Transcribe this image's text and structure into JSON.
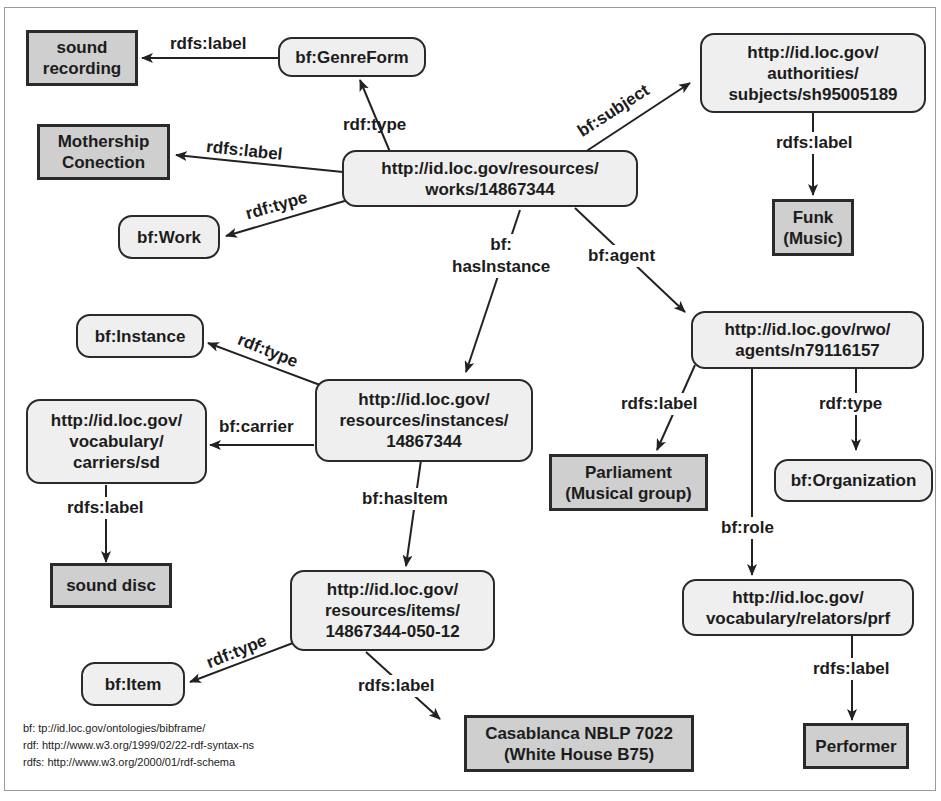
{
  "nodes": {
    "genreform": "bf:GenreForm",
    "sound_recording": "sound\nrecording",
    "mothership": "Mothership\nConection",
    "work_class": "bf:Work",
    "work": "http://id.loc.gov/resources/\nworks/14867344",
    "subject": "http://id.loc.gov/\nauthorities/\nsubjects/sh95005189",
    "funk": "Funk\n(Music)",
    "instance_class": "bf:Instance",
    "instance": "http://id.loc.gov/\nresources/instances/\n14867344",
    "carrier": "http://id.loc.gov/\nvocabulary/\ncarriers/sd",
    "sound_disc": "sound disc",
    "agent": "http://id.loc.gov/rwo/\nagents/n79116157",
    "parliament": "Parliament\n(Musical group)",
    "organization": "bf:Organization",
    "item": "http://id.loc.gov/\nresources/items/\n14867344-050-12",
    "item_class": "bf:Item",
    "casablanca": "Casablanca NBLP 7022\n(White House B75)",
    "relator": "http://id.loc.gov/\nvocabulary/relators/prf",
    "performer": "Performer"
  },
  "edges": {
    "genre_label": "rdfs:label",
    "work_genre_type": "rdf:type",
    "work_label": "rdfs:label",
    "work_type": "rdf:type",
    "work_subject": "bf:subject",
    "subject_label": "rdfs:label",
    "work_hasinstance": "bf:\nhasInstance",
    "work_agent": "bf:agent",
    "instance_type": "rdf:type",
    "instance_carrier": "bf:carrier",
    "carrier_label": "rdfs:label",
    "instance_hasitem": "bf:hasItem",
    "agent_label": "rdfs:label",
    "agent_type": "rdf:type",
    "agent_role": "bf:role",
    "item_type": "rdf:type",
    "item_label": "rdfs:label",
    "relator_label": "rdfs:label"
  },
  "legend": [
    "bf: tp://id.loc.gov/ontologies/bibframe/",
    "rdf: http://www.w3.org/1999/02/22-rdf-syntax-ns",
    "rdfs: http://www.w3.org/2000/01/rdf-schema"
  ]
}
